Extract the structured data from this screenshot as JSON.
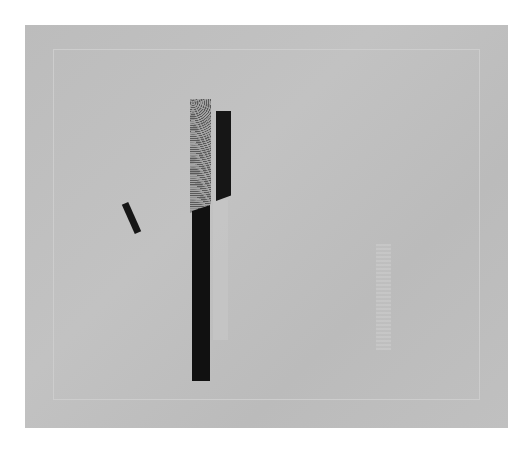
{
  "artwork": {
    "description": "Abstract constructivist composition on grey paper with a faint inner frame line",
    "colors": {
      "paper": "#bdbdbd",
      "frame_line": "#cdcdcd",
      "black": "#111111",
      "speckle": "#a4a4a4"
    },
    "elements": [
      {
        "name": "speckled-bar",
        "label": "Speckled vertical bar"
      },
      {
        "name": "black-long-bar",
        "label": "Long black vertical bar"
      },
      {
        "name": "black-short-bar",
        "label": "Short black vertical bar"
      },
      {
        "name": "tilted-bar",
        "label": "Small tilted black bar"
      },
      {
        "name": "ghost-strip",
        "label": "Faint light strip"
      },
      {
        "name": "ghost-right-strip",
        "label": "Faint textured strip right"
      }
    ]
  }
}
